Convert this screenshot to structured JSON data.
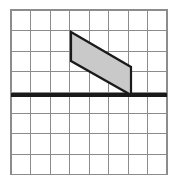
{
  "figure": {
    "type": "geometry-diagram",
    "canvas": {
      "width": 178,
      "height": 186,
      "background": "#ffffff"
    },
    "grid": {
      "label": "square grid",
      "origin_x": 11,
      "origin_y": 10,
      "columns": 8,
      "rows": 8,
      "cell_width": 19.5,
      "cell_height": 20.6,
      "line_color": "#8c8c8c",
      "line_width": 1,
      "outer_border_color": "#8c8c8c",
      "outer_border_width": 1.2
    },
    "axis_line": {
      "label": "horizontal axis line",
      "row_index": 4,
      "y": 95,
      "x_start": 11,
      "x_end": 167,
      "color": "#1a1a1a",
      "line_width": 3.4
    },
    "shape": {
      "name": "parallelogram",
      "vertices": [
        {
          "label": "top-left",
          "x": 71,
          "y": 32,
          "grid_col": 3,
          "grid_row": 1
        },
        {
          "label": "top-right",
          "x": 131,
          "y": 67,
          "grid_col": 6,
          "grid_row": 2.75
        },
        {
          "label": "bottom-right",
          "x": 131,
          "y": 95,
          "grid_col": 6,
          "grid_row": 4
        },
        {
          "label": "bottom-left",
          "x": 71,
          "y": 61,
          "grid_col": 3,
          "grid_row": 2.5
        }
      ],
      "fill_color": "#c9c9c9",
      "stroke_color": "#1a1a1a",
      "stroke_width": 2.2,
      "base_length_cells": 1.4,
      "sits_on_axis": true
    }
  }
}
